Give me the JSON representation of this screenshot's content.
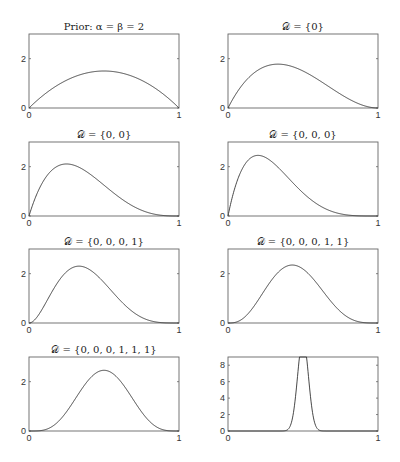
{
  "chart_data": [
    {
      "type": "line",
      "title": "Prior: α = β = 2",
      "distribution": "Beta",
      "params": {
        "a": 2,
        "b": 2
      },
      "xlim": [
        0,
        1
      ],
      "ylim": [
        0,
        3
      ],
      "xticks": [
        "0",
        "1"
      ],
      "yticks": [
        "0",
        "2"
      ],
      "peak": {
        "x": 0.5,
        "y": 1.5
      }
    },
    {
      "type": "line",
      "title": "𝒟 = {0}",
      "distribution": "Beta",
      "params": {
        "a": 2,
        "b": 3
      },
      "xlim": [
        0,
        1
      ],
      "ylim": [
        0,
        3
      ],
      "xticks": [
        "0",
        "1"
      ],
      "yticks": [
        "0",
        "2"
      ],
      "peak": {
        "x": 0.33,
        "y": 1.78
      }
    },
    {
      "type": "line",
      "title": "𝒟 = {0, 0}",
      "distribution": "Beta",
      "params": {
        "a": 2,
        "b": 4
      },
      "xlim": [
        0,
        1
      ],
      "ylim": [
        0,
        3
      ],
      "xticks": [
        "0",
        "1"
      ],
      "yticks": [
        "0",
        "2"
      ],
      "peak": {
        "x": 0.25,
        "y": 2.11
      }
    },
    {
      "type": "line",
      "title": "𝒟 = {0, 0, 0}",
      "distribution": "Beta",
      "params": {
        "a": 2,
        "b": 5
      },
      "xlim": [
        0,
        1
      ],
      "ylim": [
        0,
        3
      ],
      "xticks": [
        "0",
        "1"
      ],
      "yticks": [
        "0",
        "2"
      ],
      "peak": {
        "x": 0.2,
        "y": 2.46
      }
    },
    {
      "type": "line",
      "title": "𝒟 = {0, 0, 0, 1}",
      "distribution": "Beta",
      "params": {
        "a": 3,
        "b": 5
      },
      "xlim": [
        0,
        1
      ],
      "ylim": [
        0,
        3
      ],
      "xticks": [
        "0",
        "1"
      ],
      "yticks": [
        "0",
        "2"
      ],
      "peak": {
        "x": 0.33,
        "y": 2.3
      }
    },
    {
      "type": "line",
      "title": "𝒟 = {0, 0, 0, 1, 1}",
      "distribution": "Beta",
      "params": {
        "a": 4,
        "b": 5
      },
      "xlim": [
        0,
        1
      ],
      "ylim": [
        0,
        3
      ],
      "xticks": [
        "0",
        "1"
      ],
      "yticks": [
        "0",
        "2"
      ],
      "peak": {
        "x": 0.43,
        "y": 2.4
      }
    },
    {
      "type": "line",
      "title": "𝒟 = {0, 0, 0, 1, 1, 1}",
      "distribution": "Beta",
      "params": {
        "a": 5,
        "b": 5
      },
      "xlim": [
        0,
        1
      ],
      "ylim": [
        0,
        3
      ],
      "xticks": [
        "0",
        "1"
      ],
      "yticks": [
        "0",
        "2"
      ],
      "peak": {
        "x": 0.5,
        "y": 2.46
      }
    },
    {
      "type": "line",
      "title": "",
      "distribution": "Beta",
      "params": {
        "a": 100,
        "b": 100
      },
      "xlim": [
        0,
        1
      ],
      "ylim": [
        0,
        9
      ],
      "xticks": [
        "0",
        "1"
      ],
      "yticks": [
        "0",
        "2",
        "4",
        "6",
        "8"
      ],
      "peak": {
        "x": 0.5,
        "y": 8.0
      }
    }
  ]
}
